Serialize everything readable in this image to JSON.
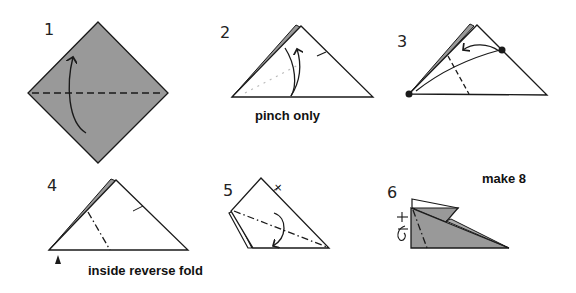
{
  "diagram": {
    "colors": {
      "paper_colored": "#999999",
      "paper_white": "#ffffff",
      "line": "#1a1a1a"
    },
    "steps": [
      {
        "number": "1",
        "instruction": ""
      },
      {
        "number": "2",
        "instruction": "pinch only"
      },
      {
        "number": "3",
        "instruction": ""
      },
      {
        "number": "4",
        "instruction": "inside reverse fold"
      },
      {
        "number": "5",
        "instruction": ""
      },
      {
        "number": "6",
        "instruction": "make 8"
      }
    ],
    "symbols": {
      "step1": [
        "valley-fold-line",
        "fold-arrow"
      ],
      "step2": [
        "pinch-mark",
        "fold-arrow",
        "dotted-reference-line"
      ],
      "step3": [
        "reference-point-dot",
        "reference-point-dot",
        "fold-arrow",
        "valley-fold-line"
      ],
      "step4": [
        "mountain-fold-line",
        "crease-mark",
        "push-arrow"
      ],
      "step5": [
        "valley-fold-line",
        "fold-arrow",
        "crease-x-mark"
      ],
      "step6": [
        "mountain-fold-line",
        "crease-mark",
        "turn-over-symbol"
      ]
    }
  }
}
